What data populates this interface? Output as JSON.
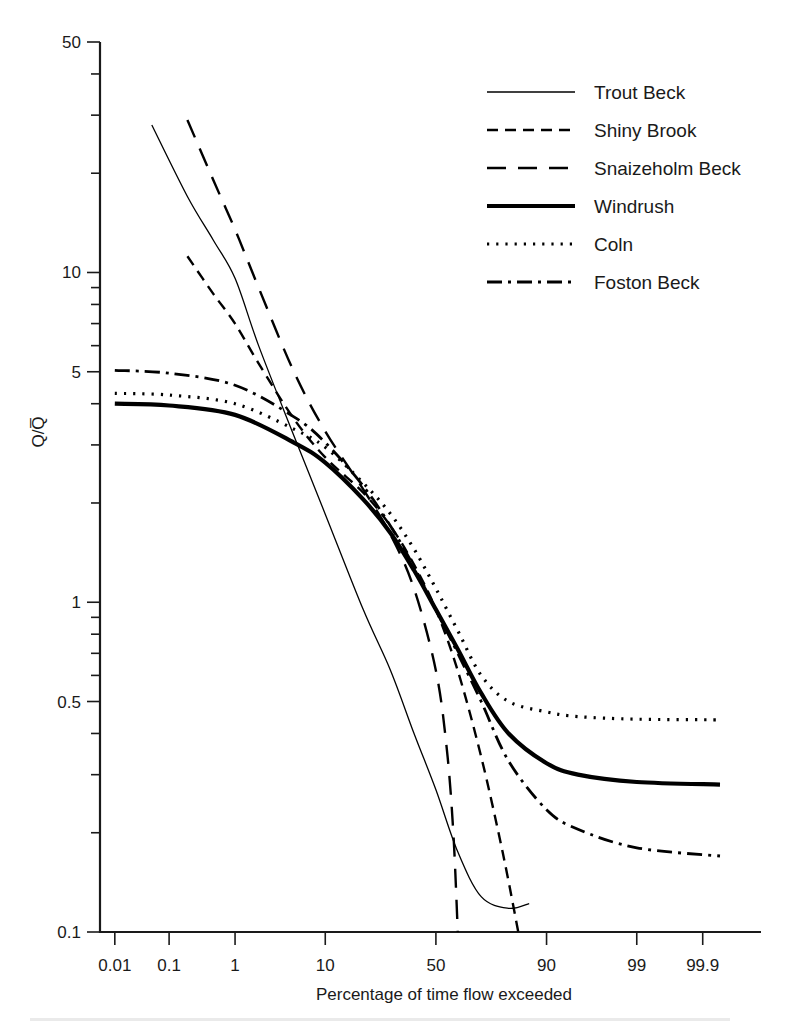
{
  "figure": {
    "background_color": "#ffffff",
    "line_color": "#000000"
  },
  "chart_data": {
    "type": "line",
    "title": "",
    "subtitle": "",
    "xlabel": "Percentage of time flow exceeded",
    "ylabel": "Q/Q̄",
    "ylabel_plain": "Q/Qbar",
    "x_scale": "normal-probability",
    "y_scale": "log",
    "xlim": [
      0.005,
      99.99
    ],
    "ylim": [
      0.1,
      50
    ],
    "grid": false,
    "legend_position": "top-right",
    "x_tick_labels": [
      "0.01",
      "0.1",
      "1",
      "10",
      "50",
      "90",
      "99",
      "99.9"
    ],
    "x_tick_values": [
      0.01,
      0.1,
      1,
      10,
      50,
      90,
      99,
      99.9
    ],
    "y_tick_labels": [
      "50",
      "10",
      "5",
      "1",
      "0.5",
      "0.1"
    ],
    "y_tick_values": [
      50,
      10,
      5,
      1,
      0.5,
      0.1
    ],
    "y_minor_ticks": [
      40,
      30,
      20,
      9,
      8,
      7,
      6,
      4,
      3,
      2,
      0.9,
      0.8,
      0.7,
      0.6,
      0.4,
      0.3,
      0.2
    ],
    "series": [
      {
        "name": "Trout Beck",
        "line_style": "solid-thin",
        "stroke_width": 1.3,
        "dash_array": "none",
        "x": [
          0.05,
          0.2,
          0.5,
          1,
          2,
          5,
          10,
          20,
          30,
          40,
          50,
          60,
          70,
          80,
          86
        ],
        "y": [
          28.0,
          17.0,
          12.5,
          9.6,
          6.0,
          3.2,
          1.85,
          0.95,
          0.62,
          0.4,
          0.27,
          0.175,
          0.128,
          0.118,
          0.122
        ]
      },
      {
        "name": "Shiny Brook",
        "line_style": "short-dash",
        "stroke_width": 2.4,
        "dash_array": "11,7",
        "x": [
          0.2,
          0.5,
          1,
          2,
          5,
          10,
          20,
          30,
          40,
          50,
          60,
          70,
          78,
          83
        ],
        "y": [
          11.2,
          8.6,
          7.0,
          5.3,
          3.6,
          2.75,
          2.15,
          1.7,
          1.3,
          0.95,
          0.62,
          0.34,
          0.175,
          0.1
        ]
      },
      {
        "name": "Snaizeholm Beck",
        "line_style": "long-dash",
        "stroke_width": 2.4,
        "dash_array": "19,12",
        "x": [
          0.2,
          0.5,
          1,
          2,
          5,
          10,
          20,
          30,
          40,
          50,
          55,
          58,
          60
        ],
        "y": [
          29.0,
          19.0,
          13.5,
          9.0,
          5.0,
          3.3,
          2.2,
          1.6,
          1.1,
          0.62,
          0.36,
          0.2,
          0.1
        ]
      },
      {
        "name": "Windrush",
        "line_style": "solid-thick",
        "stroke_width": 4.2,
        "dash_array": "none",
        "x": [
          0.01,
          0.1,
          1,
          5,
          10,
          20,
          30,
          40,
          50,
          60,
          70,
          80,
          90,
          95,
          99,
          99.95
        ],
        "y": [
          4.0,
          3.95,
          3.7,
          3.05,
          2.65,
          2.05,
          1.62,
          1.25,
          0.95,
          0.72,
          0.53,
          0.4,
          0.325,
          0.3,
          0.285,
          0.28
        ]
      },
      {
        "name": "Coln",
        "line_style": "dotted",
        "stroke_width": 3.2,
        "dash_array": "2.2,7",
        "x": [
          0.01,
          0.1,
          1,
          5,
          10,
          20,
          30,
          40,
          50,
          60,
          70,
          80,
          90,
          95,
          99,
          99.95
        ],
        "y": [
          4.3,
          4.25,
          4.0,
          3.35,
          2.95,
          2.3,
          1.85,
          1.45,
          1.1,
          0.82,
          0.6,
          0.5,
          0.465,
          0.45,
          0.442,
          0.44
        ]
      },
      {
        "name": "Foston Beck",
        "line_style": "dash-dot",
        "stroke_width": 2.8,
        "dash_array": "15,6,3,6",
        "x": [
          0.01,
          0.1,
          1,
          5,
          10,
          20,
          30,
          40,
          50,
          60,
          70,
          80,
          90,
          95,
          99,
          99.95
        ],
        "y": [
          5.05,
          4.95,
          4.55,
          3.65,
          3.05,
          2.25,
          1.7,
          1.28,
          0.95,
          0.7,
          0.5,
          0.33,
          0.235,
          0.205,
          0.18,
          0.17
        ]
      }
    ]
  },
  "legend": {
    "entries": [
      {
        "label": "Trout Beck"
      },
      {
        "label": "Shiny Brook"
      },
      {
        "label": "Snaizeholm Beck"
      },
      {
        "label": "Windrush"
      },
      {
        "label": "Coln"
      },
      {
        "label": "Foston Beck"
      }
    ]
  }
}
